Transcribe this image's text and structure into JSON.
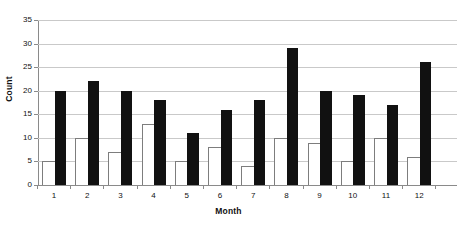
{
  "chart_data": {
    "type": "bar",
    "title": "",
    "xlabel": "Month",
    "ylabel": "Count",
    "categories": [
      "1",
      "2",
      "3",
      "4",
      "5",
      "6",
      "7",
      "8",
      "9",
      "10",
      "11",
      "12"
    ],
    "series": [
      {
        "name": "white-series",
        "style": "outlined",
        "color": "#ffffff",
        "values": [
          5,
          10,
          7,
          13,
          5,
          8,
          4,
          10,
          9,
          5,
          10,
          6
        ]
      },
      {
        "name": "black-series",
        "style": "filled",
        "color": "#111111",
        "values": [
          20,
          22,
          20,
          18,
          11,
          16,
          18,
          29,
          20,
          19,
          17,
          26
        ]
      }
    ],
    "ylim": [
      0,
      35
    ],
    "ytick_step": 5,
    "yticks": [
      "0",
      "5",
      "10",
      "15",
      "20",
      "25",
      "30",
      "35"
    ],
    "grid": "horizontal",
    "legend": "none",
    "axis_color": "#8a8a8a",
    "grid_color": "#c9c9c9"
  }
}
